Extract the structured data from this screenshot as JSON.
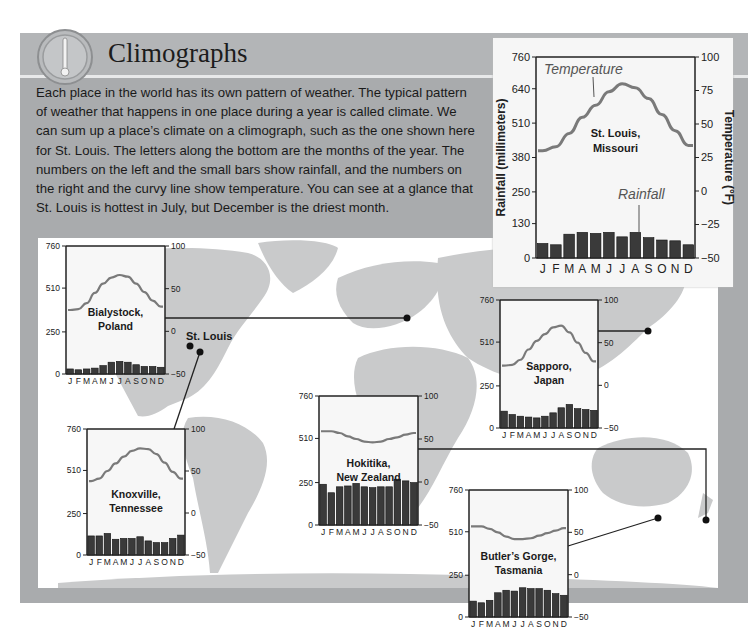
{
  "header": {
    "title": "Climographs",
    "icon": "thermometer-icon"
  },
  "intro_text": "Each place in the world has its own pattern of weather. The typical pattern of weather that happens in one place during a year is called climate. We can sum up a place’s climate on a climograph, such as the one shown here for St. Louis. The letters along the bottom are the months of the year. The numbers on the left and the small bars show rainfall, and the numbers on the right and the curvy line show temperature. You can see at a glance that St. Louis is hottest in July, but December is the driest month.",
  "map": {
    "marker_label": "St. Louis",
    "colors": {
      "land": "#c9cacb",
      "water": "#ffffff",
      "panel": "#a9abad"
    }
  },
  "chart_data": [
    {
      "id": "st-louis",
      "type": "bar+line",
      "title": "St. Louis, Missouri",
      "title_lines": [
        "St. Louis,",
        "Missouri"
      ],
      "categories": [
        "J",
        "F",
        "M",
        "A",
        "M",
        "J",
        "J",
        "A",
        "S",
        "O",
        "N",
        "D"
      ],
      "ylabel": "Rainfall (millimeters)",
      "y2label": "Temperature (°F)",
      "yticks": [
        0,
        130,
        250,
        380,
        510,
        640,
        760
      ],
      "y2ticks": [
        -50,
        -25,
        0,
        25,
        50,
        75,
        100
      ],
      "ylim": [
        0,
        760
      ],
      "y2lim": [
        -50,
        100
      ],
      "annotations": {
        "line": "Temperature",
        "bars": "Rainfall"
      },
      "series": [
        {
          "name": "Rainfall",
          "type": "bar",
          "axis": "left",
          "values": [
            55,
            50,
            90,
            97,
            93,
            97,
            80,
            97,
            77,
            68,
            65,
            50
          ]
        },
        {
          "name": "Temperature",
          "type": "line",
          "axis": "right",
          "values": [
            30,
            33,
            43,
            55,
            64,
            74,
            80,
            77,
            69,
            57,
            45,
            34
          ]
        }
      ]
    },
    {
      "id": "bialystock",
      "type": "bar+line",
      "title": "Bialystock, Poland",
      "title_lines": [
        "Bialystock,",
        "Poland"
      ],
      "categories": [
        "J",
        "F",
        "M",
        "A",
        "M",
        "J",
        "J",
        "A",
        "S",
        "O",
        "N",
        "D"
      ],
      "yticks": [
        0,
        250,
        510,
        760
      ],
      "y2ticks": [
        -50,
        0,
        50,
        100
      ],
      "ylim": [
        0,
        760
      ],
      "y2lim": [
        -50,
        100
      ],
      "series": [
        {
          "name": "Rainfall",
          "type": "bar",
          "values": [
            30,
            25,
            30,
            35,
            50,
            70,
            75,
            70,
            55,
            45,
            45,
            40
          ]
        },
        {
          "name": "Temperature",
          "type": "line",
          "values": [
            25,
            26,
            33,
            45,
            56,
            63,
            66,
            64,
            56,
            46,
            36,
            29
          ]
        }
      ]
    },
    {
      "id": "knoxville",
      "type": "bar+line",
      "title": "Knoxville, Tennessee",
      "title_lines": [
        "Knoxville,",
        "Tennessee"
      ],
      "categories": [
        "J",
        "F",
        "M",
        "A",
        "M",
        "J",
        "J",
        "A",
        "S",
        "O",
        "N",
        "D"
      ],
      "yticks": [
        0,
        250,
        510,
        760
      ],
      "y2ticks": [
        -50,
        0,
        50,
        100
      ],
      "ylim": [
        0,
        760
      ],
      "y2lim": [
        -50,
        100
      ],
      "series": [
        {
          "name": "Rainfall",
          "type": "bar",
          "values": [
            115,
            115,
            130,
            95,
            100,
            100,
            110,
            85,
            75,
            75,
            100,
            120
          ]
        },
        {
          "name": "Temperature",
          "type": "line",
          "values": [
            38,
            41,
            50,
            59,
            67,
            74,
            77,
            76,
            70,
            60,
            49,
            41
          ]
        }
      ]
    },
    {
      "id": "hokitika",
      "type": "bar+line",
      "title": "Hokitika, New Zealand",
      "title_lines": [
        "Hokitika,",
        "New Zealand"
      ],
      "categories": [
        "J",
        "F",
        "M",
        "A",
        "M",
        "J",
        "J",
        "A",
        "S",
        "O",
        "N",
        "D"
      ],
      "yticks": [
        0,
        250,
        510,
        760
      ],
      "y2ticks": [
        -50,
        0,
        50,
        100
      ],
      "ylim": [
        0,
        760
      ],
      "y2lim": [
        -50,
        100
      ],
      "series": [
        {
          "name": "Rainfall",
          "type": "bar",
          "values": [
            240,
            190,
            225,
            230,
            245,
            225,
            220,
            225,
            225,
            270,
            260,
            250
          ]
        },
        {
          "name": "Temperature",
          "type": "line",
          "values": [
            59,
            59,
            57,
            53,
            50,
            47,
            46,
            47,
            50,
            52,
            55,
            57
          ]
        }
      ]
    },
    {
      "id": "sapporo",
      "type": "bar+line",
      "title": "Sapporo, Japan",
      "title_lines": [
        "Sapporo,",
        "Japan"
      ],
      "categories": [
        "J",
        "F",
        "M",
        "A",
        "M",
        "J",
        "J",
        "A",
        "S",
        "O",
        "N",
        "D"
      ],
      "yticks": [
        0,
        250,
        510,
        760
      ],
      "y2ticks": [
        -50,
        0,
        50,
        100
      ],
      "ylim": [
        0,
        760
      ],
      "y2lim": [
        -50,
        100
      ],
      "series": [
        {
          "name": "Rainfall",
          "type": "bar",
          "values": [
            100,
            80,
            70,
            65,
            60,
            70,
            90,
            120,
            140,
            115,
            110,
            105
          ]
        },
        {
          "name": "Temperature",
          "type": "line",
          "values": [
            23,
            24,
            30,
            42,
            52,
            60,
            68,
            70,
            62,
            50,
            38,
            28
          ]
        }
      ]
    },
    {
      "id": "butlers-gorge",
      "type": "bar+line",
      "title": "Butler’s Gorge, Tasmania",
      "title_lines": [
        "Butler’s Gorge,",
        "Tasmania"
      ],
      "categories": [
        "J",
        "F",
        "M",
        "A",
        "M",
        "J",
        "J",
        "A",
        "S",
        "O",
        "N",
        "D"
      ],
      "yticks": [
        0,
        250,
        510,
        760
      ],
      "y2ticks": [
        -50,
        0,
        50,
        100
      ],
      "ylim": [
        0,
        760
      ],
      "y2lim": [
        -50,
        100
      ],
      "series": [
        {
          "name": "Rainfall",
          "type": "bar",
          "values": [
            95,
            85,
            100,
            145,
            160,
            155,
            175,
            170,
            170,
            160,
            140,
            130
          ]
        },
        {
          "name": "Temperature",
          "type": "line",
          "values": [
            57,
            57,
            54,
            50,
            45,
            42,
            42,
            43,
            46,
            49,
            52,
            55
          ]
        }
      ]
    }
  ]
}
